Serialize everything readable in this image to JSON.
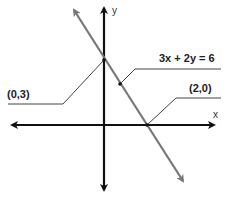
{
  "diagram": {
    "axes": {
      "x_label": "x",
      "y_label": "y"
    },
    "equation_label": "3x + 2y = 6",
    "points": [
      {
        "label": "(0,3)",
        "x": 0,
        "y": 3
      },
      {
        "label": "(2,0)",
        "x": 2,
        "y": 0
      }
    ],
    "colors": {
      "axes": "#111111",
      "line": "#777777",
      "leaders": "#444444"
    }
  }
}
